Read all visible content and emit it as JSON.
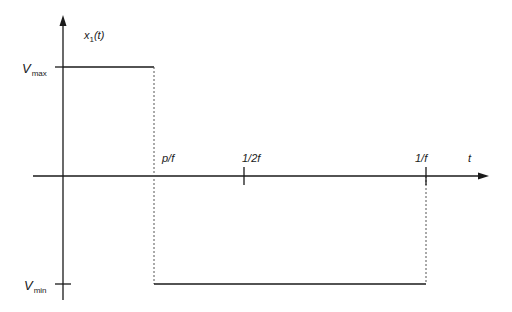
{
  "diagram": {
    "type": "pulse-waveform",
    "signal_label": {
      "name": "x",
      "subscript": "1",
      "arg": "(t)"
    },
    "y_levels": {
      "max": {
        "base": "V",
        "sub": "max"
      },
      "min": {
        "base": "V",
        "sub": "min"
      }
    },
    "x_axis_label": "t",
    "x_ticks": [
      {
        "label": "p/f"
      },
      {
        "label": "1/2f"
      },
      {
        "label": "1/f"
      }
    ],
    "colors": {
      "line": "#1a1a1a",
      "dotted": "#555555",
      "background": "#ffffff"
    }
  }
}
